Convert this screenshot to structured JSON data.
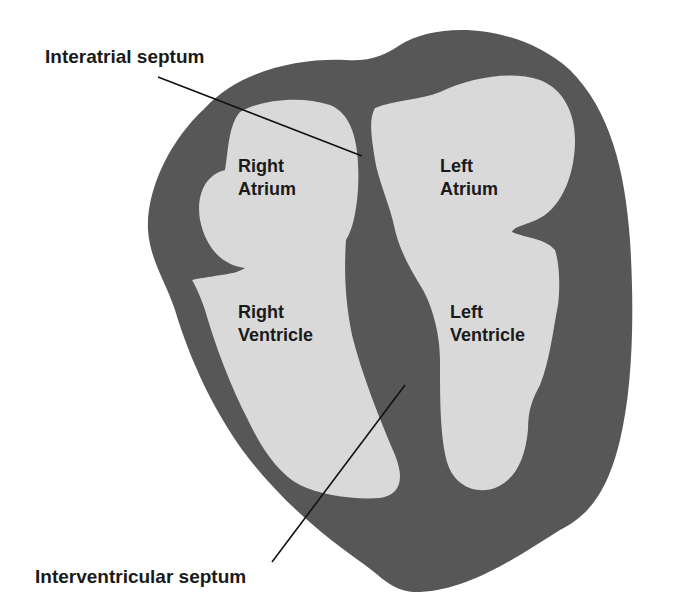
{
  "colors": {
    "wall": "#575757",
    "cavity": "#d9d9d9",
    "text": "#1a1a1a",
    "background": "#ffffff"
  },
  "callouts": {
    "interatrial": "Interatrial septum",
    "interventricular": "Interventricular septum"
  },
  "chambers": {
    "right_atrium": [
      "Right",
      "Atrium"
    ],
    "left_atrium": [
      "Left",
      "Atrium"
    ],
    "right_ventricle": [
      "Right",
      "Ventricle"
    ],
    "left_ventricle": [
      "Left",
      "Ventricle"
    ]
  }
}
